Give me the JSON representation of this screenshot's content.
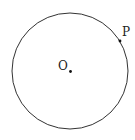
{
  "figure": {
    "center_label": "O",
    "point_label": "P",
    "stroke_color": "#333333"
  }
}
